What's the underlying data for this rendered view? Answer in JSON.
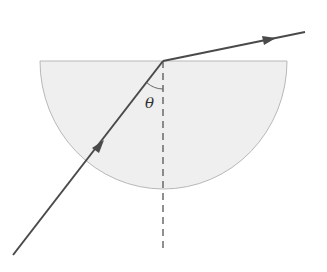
{
  "diagram": {
    "type": "optics-refraction",
    "labels": {
      "angle": "θ"
    },
    "colors": {
      "block_fill": "#efefef",
      "block_stroke": "#b8b8b8",
      "ray": "#4a4a4a",
      "normal": "#555555",
      "arc": "#666666"
    },
    "elements": {
      "semicircular_block": {
        "flat_edge_y": 61,
        "left_x": 40,
        "right_x": 287,
        "bottom_y": 189
      },
      "incident_ray": {
        "from": [
          13,
          255
        ],
        "to": [
          163,
          61
        ],
        "direction": "up-right"
      },
      "refracted_ray": {
        "from": [
          163,
          61
        ],
        "to": [
          305,
          32
        ],
        "direction": "right"
      },
      "normal_line": {
        "x": 163,
        "from_y": 61,
        "to_y": 253,
        "style": "dashed"
      },
      "angle_arc": {
        "between": [
          "incident_ray",
          "normal_line"
        ],
        "label": "θ"
      }
    }
  }
}
